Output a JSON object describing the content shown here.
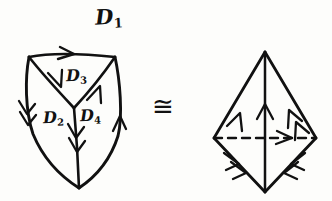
{
  "figure": {
    "kind": "hand-drawn-topology-diagram",
    "background_color": "#fdfdfb",
    "ink_color": "#111111",
    "relation_symbol": "≅",
    "relation_name": "congruent-to"
  },
  "labels": {
    "d1": {
      "base": "D",
      "subscript": "1"
    },
    "d2": {
      "base": "D",
      "subscript": "2"
    },
    "d3": {
      "base": "D",
      "subscript": "3"
    },
    "d4": {
      "base": "D",
      "subscript": "4"
    }
  },
  "left_figure": {
    "name": "subdivided-shield-region",
    "description": "Shield shaped region subdivided into four oriented triangular faces D1 D2 D3 D4",
    "edges": [
      {
        "name": "top-edge",
        "arrow_count": 1,
        "direction": "right"
      },
      {
        "name": "left-edge",
        "arrow_count": 2,
        "direction": "down"
      },
      {
        "name": "right-edge",
        "arrow_count": 1,
        "direction": "up"
      },
      {
        "name": "left-diagonal",
        "arrow_count": 1,
        "direction": "down-right"
      },
      {
        "name": "right-diagonal",
        "arrow_count": 1,
        "direction": "up-right"
      },
      {
        "name": "center-vertical",
        "arrow_count": 2,
        "direction": "down"
      }
    ]
  },
  "right_figure": {
    "name": "bipyramid-region",
    "description": "Rhombic bipyramid with dashed equator, vertical axis and four oriented slant edges",
    "edges": [
      {
        "name": "upper-left-edge",
        "arrow_count": 1,
        "direction": "up-right"
      },
      {
        "name": "upper-right-edge",
        "arrow_count": 2,
        "direction": "up-left"
      },
      {
        "name": "lower-left-edge",
        "arrow_count": 2,
        "direction": "down-right"
      },
      {
        "name": "lower-right-edge",
        "arrow_count": 2,
        "direction": "down-left"
      },
      {
        "name": "vertical-axis",
        "arrow_count": 1,
        "direction": "up"
      },
      {
        "name": "dashed-equator",
        "arrow_count": 1,
        "direction": "right",
        "style": "dashed"
      }
    ]
  }
}
